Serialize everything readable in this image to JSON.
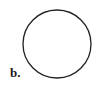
{
  "figure": {
    "panel_label": "b.",
    "shape": {
      "type": "circle",
      "cx": 57,
      "cy": 44,
      "r": 34,
      "stroke": "#222222",
      "stroke_width": 1.3,
      "fill": "none"
    }
  }
}
